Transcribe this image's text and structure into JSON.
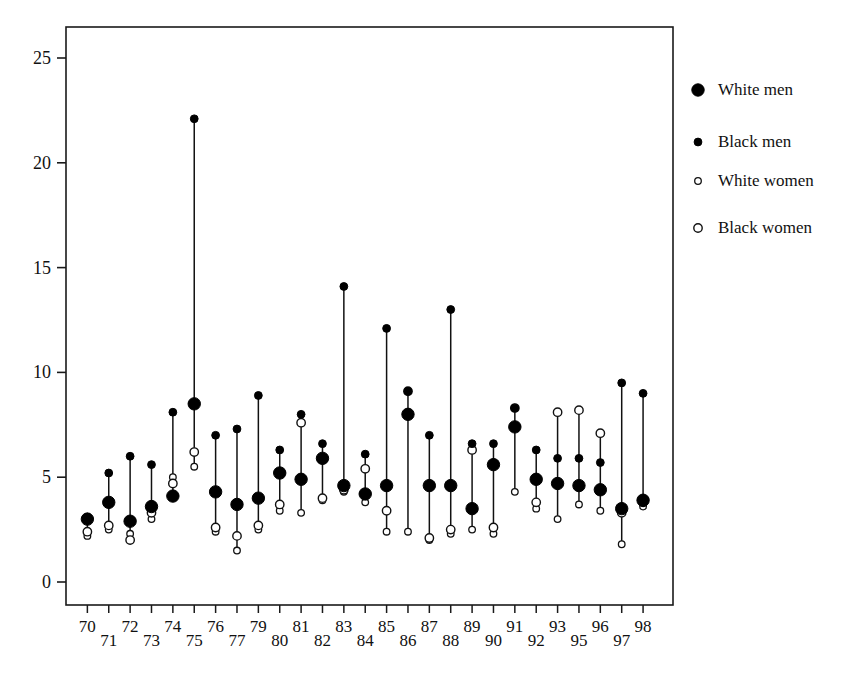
{
  "chart_data": {
    "type": "scatter",
    "title": "",
    "subtitle": "",
    "xlabel": "",
    "ylabel": "",
    "grid": false,
    "legend_position": "right",
    "xlim": [
      0,
      29
    ],
    "ylim": [
      0,
      26
    ],
    "yticks": [
      0,
      5,
      10,
      15,
      20,
      25
    ],
    "ytick_labels": [
      "0",
      "5",
      "10",
      "15",
      "20",
      "25"
    ],
    "categories": [
      "70",
      "71",
      "72",
      "73",
      "74",
      "75",
      "76",
      "77",
      "79",
      "80",
      "81",
      "82",
      "83",
      "84",
      "85",
      "86",
      "87",
      "88",
      "89",
      "90",
      "91",
      "92",
      "93",
      "95",
      "96",
      "97",
      "98"
    ],
    "xtick_labels_top": [
      "70",
      "72",
      "74",
      "76",
      "79",
      "81",
      "83",
      "85",
      "87",
      "89",
      "91",
      "93",
      "96",
      "98"
    ],
    "xtick_labels_bottom": [
      "71",
      "73",
      "75",
      "77",
      "80",
      "82",
      "84",
      "86",
      "88",
      "90",
      "92",
      "95",
      "97"
    ],
    "series": [
      {
        "name": "White men",
        "marker": "large-filled-circle",
        "color": "#000000",
        "values": [
          3.0,
          3.8,
          2.9,
          3.6,
          4.1,
          8.5,
          4.3,
          3.7,
          4.0,
          5.2,
          4.9,
          5.9,
          4.6,
          4.2,
          4.6,
          8.0,
          4.6,
          4.6,
          3.5,
          5.6,
          7.4,
          4.9,
          4.7,
          4.6,
          4.4,
          3.5,
          3.9
        ]
      },
      {
        "name": "Black men",
        "marker": "small-filled-circle",
        "color": "#000000",
        "values": [
          3.1,
          5.2,
          6.0,
          5.6,
          8.1,
          22.1,
          7.0,
          7.3,
          8.9,
          6.3,
          8.0,
          6.6,
          14.1,
          6.1,
          12.1,
          9.1,
          7.0,
          13.0,
          6.6,
          6.6,
          8.3,
          6.3,
          5.9,
          5.9,
          5.7,
          9.5,
          9.0
        ]
      },
      {
        "name": "White women",
        "marker": "small-open-circle",
        "color": "#ffffff",
        "values": [
          2.2,
          2.5,
          2.3,
          3.0,
          5.0,
          5.5,
          2.4,
          1.5,
          2.5,
          3.4,
          3.3,
          3.9,
          4.3,
          3.8,
          2.4,
          2.4,
          2.0,
          2.3,
          2.5,
          2.3,
          4.3,
          3.5,
          3.0,
          3.7,
          3.4,
          1.8,
          3.6
        ]
      },
      {
        "name": "Black women",
        "marker": "medium-open-circle",
        "color": "#ffffff",
        "values": [
          2.4,
          2.7,
          2.0,
          3.3,
          4.7,
          6.2,
          2.6,
          2.2,
          2.7,
          3.7,
          7.6,
          4.0,
          4.4,
          5.4,
          3.4,
          9.1,
          2.1,
          2.5,
          6.3,
          2.6,
          8.3,
          3.8,
          8.1,
          8.2,
          7.1,
          3.3,
          3.8
        ]
      }
    ]
  },
  "legend": {
    "items": [
      {
        "label": "White men",
        "marker": "large-filled-circle"
      },
      {
        "label": "Black men",
        "marker": "small-filled-circle"
      },
      {
        "label": "White women",
        "marker": "small-open-circle"
      },
      {
        "label": "Black women",
        "marker": "medium-open-circle"
      }
    ]
  }
}
